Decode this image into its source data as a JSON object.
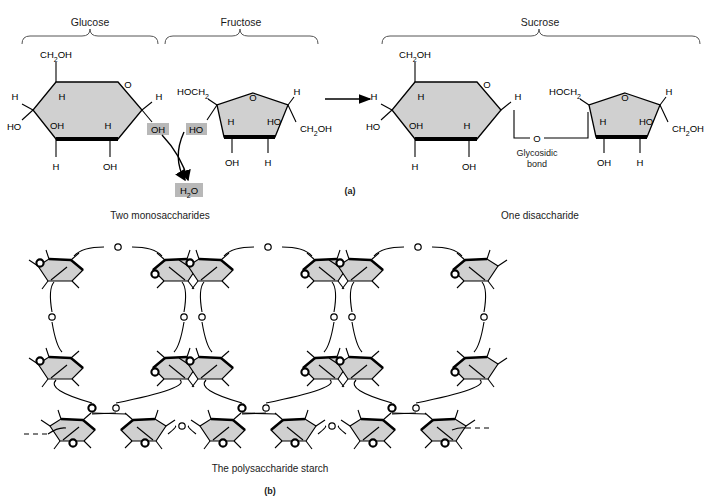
{
  "figure": {
    "domain": "diagram",
    "background_color": "#ffffff",
    "ring_fill_color": "#d0d0d0",
    "ring_stroke_color": "#000000",
    "highlight_box_color": "#b8b8b8",
    "text_color": "#1a1a1a",
    "bond_line_color": "#000000"
  },
  "panel_a": {
    "panel_label": "(a)",
    "braces": [
      {
        "label": "Glucose",
        "x_start": 22,
        "y": 30,
        "x_end": 160
      },
      {
        "label": "Fructose",
        "x_start": 163,
        "y": 30,
        "x_end": 318
      },
      {
        "label": "Sucrose",
        "x_start": 378,
        "y": 30,
        "x_end": 700
      }
    ],
    "reactant_caption": "Two monosaccharides",
    "product_caption": "One disaccharide",
    "byproduct_label": "H2O",
    "byproduct_label_parts": {
      "pre": "H",
      "sub": "2",
      "post": "O"
    },
    "bond_label_line1": "Glycosidic",
    "bond_label_line2": "bond",
    "glucose_ring": {
      "name": "glucose-pyranose-ring",
      "shape": "hexagon",
      "labels": [
        {
          "text": "CH2OH",
          "role": "c6-hydroxymethyl",
          "position": "top-left-up"
        },
        {
          "text": "O",
          "role": "ring-oxygen",
          "position": "top-right-vertex"
        },
        {
          "text": "H",
          "role": "h-c5-left-outer",
          "position": "left-upper-out"
        },
        {
          "text": "H",
          "role": "h-c5-inner",
          "position": "inner-upper-left"
        },
        {
          "text": "HO",
          "role": "oh-c3",
          "position": "left-lower-out"
        },
        {
          "text": "OH",
          "role": "oh-inner-left",
          "position": "inner-lower-left"
        },
        {
          "text": "H",
          "role": "h-inner-right",
          "position": "inner-lower-right"
        },
        {
          "text": "H",
          "role": "h-c1-right-out",
          "position": "right-upper-out"
        },
        {
          "text": "OH",
          "role": "anomeric-oh",
          "position": "right-lower-out",
          "highlighted": true
        },
        {
          "text": "H",
          "role": "h-c3-down",
          "position": "bottom-left-down"
        },
        {
          "text": "OH",
          "role": "oh-c2-down",
          "position": "bottom-right-down"
        }
      ]
    },
    "fructose_ring": {
      "name": "fructose-furanose-ring",
      "shape": "pentagon",
      "labels": [
        {
          "text": "HOCH2",
          "role": "c6-hydroxymethyl",
          "position": "top-left-out"
        },
        {
          "text": "O",
          "role": "ring-oxygen",
          "position": "top-vertex"
        },
        {
          "text": "H",
          "role": "h-top-right-out",
          "position": "top-right-out"
        },
        {
          "text": "H",
          "role": "h-inner-left",
          "position": "inner-left"
        },
        {
          "text": "HO",
          "role": "anomeric-oh",
          "position": "left-out",
          "highlighted": true
        },
        {
          "text": "HO",
          "role": "oh-inner-right",
          "position": "inner-right"
        },
        {
          "text": "CH2OH",
          "role": "c1-hydroxymethyl",
          "position": "right-out"
        },
        {
          "text": "OH",
          "role": "oh-bottom-left",
          "position": "bottom-left-down"
        },
        {
          "text": "H",
          "role": "h-bottom-right",
          "position": "bottom-right-down"
        }
      ]
    },
    "sucrose_glucose_ring": {
      "name": "sucrose-glucose-unit",
      "shape": "hexagon",
      "labels": [
        {
          "text": "CH2OH",
          "role": "c6-hydroxymethyl"
        },
        {
          "text": "O",
          "role": "ring-oxygen"
        },
        {
          "text": "H",
          "role": "h-left-out"
        },
        {
          "text": "H",
          "role": "h-inner-upper"
        },
        {
          "text": "HO",
          "role": "oh-left-out"
        },
        {
          "text": "OH",
          "role": "oh-inner-lower-left"
        },
        {
          "text": "H",
          "role": "h-inner-lower-right"
        },
        {
          "text": "H",
          "role": "h-right-out"
        },
        {
          "text": "H",
          "role": "h-bottom-left-down"
        },
        {
          "text": "OH",
          "role": "oh-bottom-right-down"
        }
      ]
    },
    "sucrose_fructose_ring": {
      "name": "sucrose-fructose-unit",
      "shape": "pentagon",
      "labels": [
        {
          "text": "HOCH2",
          "role": "c6-hydroxymethyl"
        },
        {
          "text": "O",
          "role": "ring-oxygen"
        },
        {
          "text": "H",
          "role": "h-top-right-out"
        },
        {
          "text": "H",
          "role": "h-inner-left"
        },
        {
          "text": "HO",
          "role": "oh-inner-right"
        },
        {
          "text": "CH2OH",
          "role": "c1-hydroxymethyl"
        },
        {
          "text": "OH",
          "role": "oh-bottom-left-down"
        },
        {
          "text": "H",
          "role": "h-bottom-right-down"
        }
      ]
    },
    "bridge_oxygen_label": "O",
    "reaction_arrow": {
      "direction": "right",
      "from_x": 325,
      "to_x": 372,
      "y": 99
    }
  },
  "panel_b": {
    "panel_label": "(b)",
    "caption": "The polysaccharide starch",
    "repeat_units": 3,
    "rings_per_unit": 6,
    "bridge_oxygen_label": "O",
    "chain_ends": [
      "dashed-left",
      "dashed-right"
    ],
    "description": "Branched starch: three repeating loops of glucose rings joined by glycosidic oxygen bridges, with a horizontal backbone chain at the bottom terminating in dashed continuation marks."
  }
}
